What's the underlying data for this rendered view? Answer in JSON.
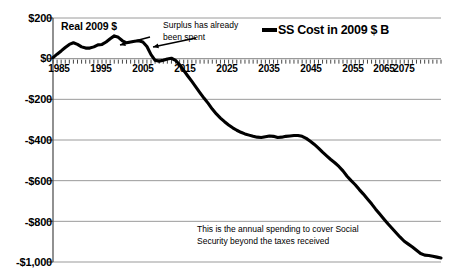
{
  "chart_data": {
    "type": "line",
    "title": "",
    "xlabel": "",
    "ylabel": "",
    "xlim": [
      1985,
      2080
    ],
    "ylim": [
      -1000,
      200
    ],
    "grid": true,
    "grid_axis": "y",
    "legend_position": "top-right",
    "y_ticks": [
      "$200",
      "$0",
      "-$200",
      "-$400",
      "-$600",
      "-$800",
      "-$1,000"
    ],
    "y_tick_values": [
      200,
      0,
      -200,
      -400,
      -600,
      -800,
      -1000
    ],
    "x_ticks": [
      "1985",
      "1995",
      "2005",
      "2015",
      "2025",
      "2035",
      "2045",
      "2055",
      "2065",
      "2075"
    ],
    "x_tick_values": [
      1985,
      1995,
      2005,
      2015,
      2025,
      2035,
      2045,
      2055,
      2065,
      2075
    ],
    "x_minor_tick_interval": 1,
    "line_color": "#000000",
    "grid_color": "#9a9a9a",
    "series": [
      {
        "name": "SS Cost in 2009 $ B",
        "x": [
          1985,
          1986,
          1987,
          1988,
          1989,
          1990,
          1991,
          1992,
          1993,
          1994,
          1995,
          1996,
          1997,
          1998,
          1999,
          2000,
          2001,
          2002,
          2003,
          2004,
          2005,
          2006,
          2007,
          2008,
          2009,
          2010,
          2011,
          2012,
          2013,
          2014,
          2015,
          2016,
          2017,
          2018,
          2019,
          2020,
          2021,
          2022,
          2023,
          2024,
          2025,
          2026,
          2027,
          2028,
          2029,
          2030,
          2031,
          2032,
          2033,
          2034,
          2035,
          2036,
          2037,
          2038,
          2039,
          2040,
          2041,
          2042,
          2043,
          2044,
          2045,
          2046,
          2047,
          2048,
          2049,
          2050,
          2051,
          2052,
          2053,
          2054,
          2055,
          2056,
          2057,
          2058,
          2059,
          2060,
          2061,
          2062,
          2063,
          2064,
          2065,
          2066,
          2067,
          2068,
          2069,
          2070,
          2071,
          2072,
          2073,
          2074,
          2075,
          2076,
          2077,
          2078,
          2079,
          2080
        ],
        "values": [
          5,
          22,
          38,
          55,
          70,
          78,
          70,
          58,
          52,
          52,
          58,
          68,
          70,
          82,
          98,
          112,
          105,
          88,
          78,
          82,
          86,
          88,
          82,
          60,
          20,
          -8,
          -12,
          -8,
          -2,
          2,
          -8,
          -30,
          -58,
          -85,
          -112,
          -140,
          -168,
          -195,
          -220,
          -248,
          -272,
          -292,
          -310,
          -326,
          -340,
          -352,
          -362,
          -370,
          -376,
          -382,
          -386,
          -388,
          -384,
          -380,
          -382,
          -388,
          -386,
          -382,
          -380,
          -378,
          -378,
          -382,
          -392,
          -406,
          -422,
          -440,
          -460,
          -478,
          -496,
          -512,
          -530,
          -552,
          -578,
          -600,
          -620,
          -644,
          -666,
          -690,
          -714,
          -740,
          -764,
          -788,
          -812,
          -834,
          -856,
          -878,
          -898,
          -912,
          -926,
          -942,
          -958,
          -966,
          -968,
          -972,
          -976,
          -980
        ]
      }
    ],
    "annotations": [
      {
        "name": "real-dollars-label",
        "text": "Real 2009 $",
        "has_arrow": true,
        "arrow_from": [
          150,
          37
        ],
        "arrow_to": [
          120,
          45
        ]
      },
      {
        "name": "surplus-note",
        "text": "Surplus has already\nbeen spent",
        "has_arrow": true,
        "arrow_from": [
          196,
          38
        ],
        "arrow_to": [
          153,
          47
        ]
      },
      {
        "name": "deficit-note",
        "text": "This is the annual spending to cover Social\nSecurity beyond the taxes received",
        "has_arrow": false
      }
    ]
  },
  "legend": {
    "entries": [
      {
        "label": "SS Cost in 2009 $ B",
        "color": "#000000"
      }
    ]
  }
}
